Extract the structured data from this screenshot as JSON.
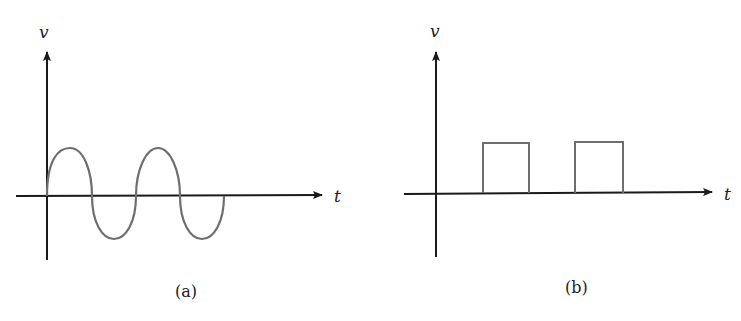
{
  "panels": [
    {
      "id": "a",
      "caption": "(a)",
      "y_axis_label": "v",
      "x_axis_label": "t",
      "waveform": "sine",
      "description": "Sinusoidal voltage, two full cycles"
    },
    {
      "id": "b",
      "caption": "(b)",
      "y_axis_label": "v",
      "x_axis_label": "t",
      "waveform": "rectangular-pulses",
      "description": "Two rectangular voltage pulses"
    }
  ],
  "colors": {
    "axis": "#1a1a1a",
    "waveform": "#6e6e6e",
    "text": "#222222"
  }
}
